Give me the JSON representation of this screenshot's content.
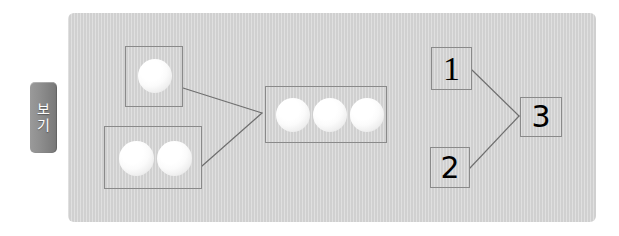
{
  "tab": {
    "name": "view-tab",
    "label": "보기",
    "chars": [
      "보",
      "기"
    ],
    "bg_color": "#8a8a8a",
    "text_color": "#ffffff"
  },
  "panel": {
    "bg_color": "#d2d2d2",
    "border_radius": 6
  },
  "diagram": {
    "type": "addition-grouping",
    "style": {
      "box_border_color": "#8a8a8a",
      "line_color": "#6f6f6f",
      "ball_color": "#ffffff"
    },
    "left_side": {
      "groups": [
        {
          "name": "group-box-top-left",
          "ball_count": 1,
          "balls": [
            "ball"
          ]
        },
        {
          "name": "group-box-bottom-left",
          "ball_count": 2,
          "balls": [
            "ball",
            "ball"
          ]
        }
      ],
      "result_group": {
        "name": "group-box-combined",
        "ball_count": 3,
        "balls": [
          "ball",
          "ball",
          "ball"
        ]
      }
    },
    "right_side": {
      "operands": [
        {
          "name": "numeral-box-1",
          "label": "1"
        },
        {
          "name": "numeral-box-2",
          "label": "2"
        }
      ],
      "result": {
        "name": "numeral-box-3",
        "label": "3"
      }
    },
    "connectors": [
      {
        "from": "group-box-top-left",
        "to": "group-box-combined"
      },
      {
        "from": "group-box-bottom-left",
        "to": "group-box-combined"
      },
      {
        "from": "numeral-box-1",
        "to": "numeral-box-3"
      },
      {
        "from": "numeral-box-2",
        "to": "numeral-box-3"
      }
    ]
  }
}
